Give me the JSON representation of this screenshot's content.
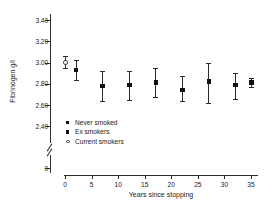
{
  "chart_data": {
    "type": "scatter",
    "title": "",
    "xlabel": "Years since stopping",
    "ylabel": "Fibrinogen g/l",
    "xlim": [
      0,
      35
    ],
    "ylim": [
      2.4,
      3.4
    ],
    "y_axis_break": true,
    "y_break_label": "0",
    "grid": false,
    "legend_position": "center-left",
    "xticks": [
      "0",
      "5",
      "10",
      "15",
      "20",
      "25",
      "30",
      "35"
    ],
    "xtick_values": [
      0,
      5,
      10,
      15,
      20,
      25,
      30,
      35
    ],
    "yticks": [
      "3.40",
      "3.20",
      "3.00",
      "2.80",
      "2.60",
      "2.40"
    ],
    "ytick_values": [
      3.4,
      3.2,
      3.0,
      2.8,
      2.6,
      2.4
    ],
    "series": [
      {
        "name": "Current smokers",
        "marker": "open-circle",
        "color": "#333333",
        "points": [
          {
            "x": 0.0,
            "y": 3.0,
            "low": 2.95,
            "high": 3.06
          }
        ]
      },
      {
        "name": "Ex smokers",
        "marker": "filled-square",
        "color": "#111111",
        "points": [
          {
            "x": 2.0,
            "y": 2.93,
            "low": 2.84,
            "high": 3.02
          },
          {
            "x": 7.0,
            "y": 2.78,
            "low": 2.64,
            "high": 2.92
          },
          {
            "x": 12.0,
            "y": 2.79,
            "low": 2.65,
            "high": 2.92
          },
          {
            "x": 17.0,
            "y": 2.81,
            "low": 2.68,
            "high": 2.95
          },
          {
            "x": 22.0,
            "y": 2.74,
            "low": 2.64,
            "high": 2.87
          },
          {
            "x": 27.0,
            "y": 2.82,
            "low": 2.62,
            "high": 3.0
          },
          {
            "x": 32.0,
            "y": 2.79,
            "low": 2.66,
            "high": 2.9
          }
        ]
      },
      {
        "name": "Never smoked",
        "marker": "filled-square",
        "color": "#111111",
        "points": [
          {
            "x": 35.0,
            "y": 2.81,
            "low": 2.77,
            "high": 2.85
          }
        ]
      }
    ]
  },
  "legend": {
    "items": [
      {
        "label": "Never smoked",
        "marker": "filled-square"
      },
      {
        "label": "Ex smokers",
        "marker": "filled-square"
      },
      {
        "label": "Current smokers",
        "marker": "open-circle"
      }
    ]
  }
}
